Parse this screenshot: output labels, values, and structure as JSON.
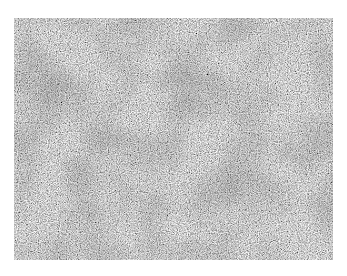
{
  "image": {
    "subject": "grayscale granular texture (micrograph-like)",
    "base_color": "#9a9a9a",
    "light_color": "#d8d8d8",
    "dark_color": "#3c3c3c",
    "background": "#ffffff"
  }
}
